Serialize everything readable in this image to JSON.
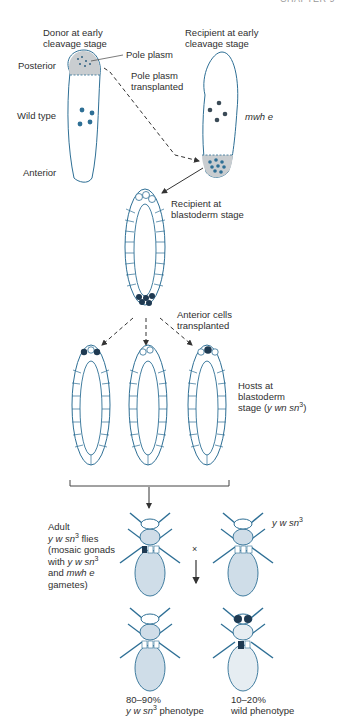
{
  "header": {
    "chapter_label": "CHAPTER 9"
  },
  "stage1": {
    "donor_title_line1": "Donor at early",
    "donor_title_line2": "cleavage stage",
    "recipient_title_line1": "Recipient at early",
    "recipient_title_line2": "cleavage stage",
    "pole_plasm": "Pole plasm",
    "posterior": "Posterior",
    "transplant_line1": "Pole plasm",
    "transplant_line2": "transplanted",
    "wild_type": "Wild type",
    "anterior": "Anterior",
    "recipient_genotype": "mwh e"
  },
  "stage2": {
    "recipient_blasto_line1": "Recipient at",
    "recipient_blasto_line2": "blastoderm stage",
    "anterior_cells_line1": "Anterior cells",
    "anterior_cells_line2": "transplanted"
  },
  "stage3": {
    "hosts_line1": "Hosts at",
    "hosts_line2": "blastoderm",
    "hosts_line3_prefix": "stage (",
    "hosts_genotype": "y wn sn",
    "hosts_sup": "3",
    "hosts_suffix": ")"
  },
  "stage4": {
    "adult_line1": "Adult",
    "adult_line2_geno": "y w sn",
    "adult_line2_sup": "3",
    "adult_line2_suffix": " flies",
    "adult_line3": "(mosaic gonads",
    "adult_line4_prefix": "with ",
    "adult_line4_geno": "y w sn",
    "adult_line4_sup": "3",
    "adult_line5_prefix": "and ",
    "adult_line5_geno": "mwh e",
    "adult_line6": "gametes)",
    "cross_symbol": "×",
    "mate_geno": "y w sn",
    "mate_sup": "3"
  },
  "results": {
    "left_pct": "80–90%",
    "left_geno": "y w sn",
    "left_sup": "3",
    "left_suffix": " phenotype",
    "right_pct": "10–20%",
    "right_label": "wild phenotype"
  },
  "colors": {
    "outline": "#2e6f95",
    "nucleus": "#2e6f95",
    "dark_cell": "#1f3a52",
    "pole_plasm_fill": "#c9cdd0",
    "fly_body": "#cfdde8",
    "arrow": "#333333"
  }
}
